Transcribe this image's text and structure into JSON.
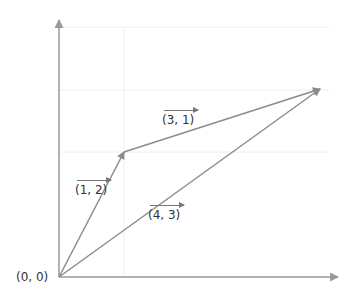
{
  "diagram": {
    "type": "vector-addition",
    "origin_label": "(0, 0)",
    "vectors": [
      {
        "name": "a",
        "label": "(1, 2)",
        "from": [
          0,
          0
        ],
        "to": [
          1,
          2
        ]
      },
      {
        "name": "b",
        "label": "(3, 1)",
        "from": [
          1,
          2
        ],
        "to": [
          4,
          3
        ]
      },
      {
        "name": "sum",
        "label": "(4, 3)",
        "from": [
          0,
          0
        ],
        "to": [
          4,
          3
        ]
      }
    ],
    "colors": {
      "axis": "#999999",
      "vector": "#8c8c8c",
      "grid": "#eeeeee",
      "text": "#333333"
    }
  }
}
